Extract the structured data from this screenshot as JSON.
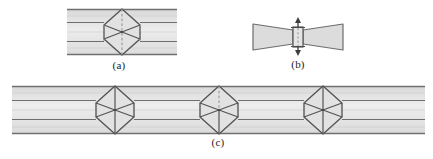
{
  "figure": {
    "type": "schematic-diagram",
    "background_color": "#ffffff",
    "panels": [
      {
        "id": "a",
        "caption": "(a)",
        "kind": "banded-strip-with-hexagon",
        "x": 67,
        "y": 9,
        "width": 110,
        "height": 46,
        "band_fill": "#dedede",
        "band_fill_light": "#e9e9e9",
        "line_color": "#6b6b6b",
        "dark_line_color": "#4a4a4a",
        "dashed_line_color": "#8a8a8a",
        "horizontal_lines_y": [
          9,
          22,
          41,
          55
        ],
        "node": {
          "center_x": 122,
          "center_y": 32,
          "half_width": 18,
          "half_height": 23,
          "waist_half_height": 7,
          "dashed_vertical": true,
          "dashed_flanks": true
        }
      },
      {
        "id": "b",
        "caption": "(b)",
        "kind": "necked-bowtie",
        "x": 253,
        "y": 22,
        "width": 90,
        "height": 28,
        "band_fill": "#dedede",
        "line_color": "#6b6b6b",
        "dark_line_color": "#4a4a4a",
        "neck": {
          "center_x": 297,
          "half_width": 4,
          "top_y": 19,
          "bottom_y": 53,
          "arrow_top": true,
          "arrow_bottom": true,
          "dashed_center_line": true
        }
      },
      {
        "id": "c",
        "caption": "(c)",
        "kind": "banded-strip-with-hexagons",
        "x": 12,
        "y": 86,
        "width": 413,
        "height": 48,
        "band_fill": "#dedede",
        "band_fill_light": "#e9e9e9",
        "line_color": "#6b6b6b",
        "dark_line_color": "#4a4a4a",
        "dashed_line_color": "#8a8a8a",
        "horizontal_lines_y": [
          86,
          100,
          120,
          134
        ],
        "nodes": [
          {
            "center_x": 115,
            "center_y": 110,
            "half_width": 19,
            "half_height": 25,
            "waist_half_height": 7,
            "dashed_vertical": false
          },
          {
            "center_x": 219,
            "center_y": 110,
            "half_width": 19,
            "half_height": 25,
            "waist_half_height": 7,
            "dashed_vertical": true
          },
          {
            "center_x": 323,
            "center_y": 110,
            "half_width": 19,
            "half_height": 25,
            "waist_half_height": 7,
            "dashed_vertical": false
          }
        ]
      }
    ]
  },
  "captions": {
    "a": "(a)",
    "b": "(b)",
    "c": "(c)"
  },
  "colors": {
    "page_background": "#ffffff",
    "band_fill": "#dedede",
    "band_fill_light": "#e9e9e9",
    "stroke": "#6b6b6b",
    "stroke_dark": "#4a4a4a",
    "stroke_dashed": "#8a8a8a",
    "text": "#1a1a1a"
  }
}
